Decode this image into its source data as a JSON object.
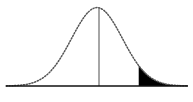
{
  "figure": {
    "title": "Normal distribution curve with shaded right tail",
    "type": "statistical-diagram",
    "width_px": 193,
    "height_px": 102,
    "background_color": "#ffffff",
    "caption": ""
  },
  "chart_data": {
    "type": "area",
    "title": "Normal distribution curve with shaded right tail",
    "subtitle": "",
    "xlabel": "",
    "ylabel": "",
    "xlim": [
      -3.6,
      3.6
    ],
    "ylim": [
      0,
      0.4
    ],
    "grid": false,
    "legend": null,
    "annotations": [],
    "tick_labels": {
      "x": [],
      "y": []
    },
    "series": [
      {
        "name": "standard-normal-density",
        "style": "dotted",
        "color": "#555555",
        "x": [
          -3.6,
          -3.4,
          -3.2,
          -3.0,
          -2.8,
          -2.6,
          -2.4,
          -2.2,
          -2.0,
          -1.8,
          -1.6,
          -1.4,
          -1.2,
          -1.0,
          -0.8,
          -0.6,
          -0.4,
          -0.2,
          0.0,
          0.2,
          0.4,
          0.6,
          0.8,
          1.0,
          1.2,
          1.4,
          1.6,
          1.8,
          2.0,
          2.2,
          2.4,
          2.6,
          2.8,
          3.0,
          3.2,
          3.4,
          3.6
        ],
        "y": [
          0.0006,
          0.0012,
          0.0024,
          0.0044,
          0.0079,
          0.0136,
          0.0224,
          0.0355,
          0.054,
          0.079,
          0.1109,
          0.1497,
          0.1942,
          0.242,
          0.2897,
          0.3332,
          0.3683,
          0.391,
          0.3989,
          0.391,
          0.3683,
          0.3332,
          0.2897,
          0.242,
          0.1942,
          0.1497,
          0.1109,
          0.079,
          0.054,
          0.0355,
          0.0224,
          0.0136,
          0.0079,
          0.0044,
          0.0024,
          0.0012,
          0.0006
        ]
      }
    ],
    "shaded_region": {
      "name": "right-tail",
      "fill_color": "#000000",
      "from_x": 1.65,
      "to_x": 3.6,
      "label": ""
    },
    "reference_line": {
      "name": "mean-line",
      "orientation": "vertical",
      "x": 0.0,
      "color": "#6b6b6b",
      "from_y": 0,
      "to_y": 0.3989
    },
    "axis_line": {
      "name": "baseline",
      "orientation": "horizontal",
      "y": 0,
      "color": "#111111"
    }
  },
  "geometry": {
    "baseline_y": 86,
    "baseline_x_start": 6,
    "baseline_x_end": 188,
    "peak_x": 98,
    "peak_y": 7,
    "mean_line_x": 99,
    "shade_start_x": 143
  },
  "colors": {
    "curve": "#555555",
    "shade": "#000000",
    "baseline": "#111111",
    "mean_line": "#6b6b6b",
    "background": "#ffffff"
  }
}
